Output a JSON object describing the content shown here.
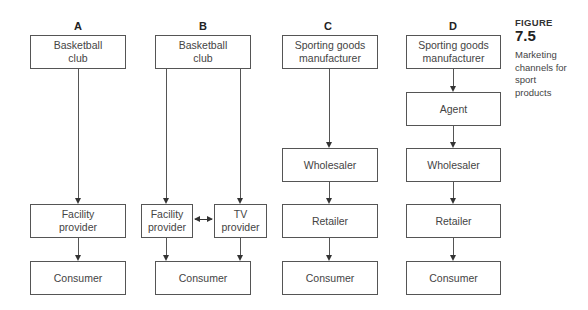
{
  "figure": {
    "kicker": "FIGURE",
    "number": "7.5",
    "caption": "Marketing channels for sport products"
  },
  "columns": {
    "A": {
      "label": "A",
      "nodes": [
        "Basketball club",
        "Facility provider",
        "Consumer"
      ]
    },
    "B": {
      "label": "B",
      "nodes": [
        "Basketball club",
        "Facility provider",
        "TV provider",
        "Consumer"
      ]
    },
    "C": {
      "label": "C",
      "nodes": [
        "Sporting goods manufacturer",
        "Wholesaler",
        "Retailer",
        "Consumer"
      ]
    },
    "D": {
      "label": "D",
      "nodes": [
        "Sporting goods manufacturer",
        "Agent",
        "Wholesaler",
        "Retailer",
        "Consumer"
      ]
    }
  },
  "edges": [
    [
      "A.0",
      "A.1"
    ],
    [
      "A.1",
      "A.2"
    ],
    [
      "B.0",
      "B.1"
    ],
    [
      "B.0",
      "B.2"
    ],
    [
      "B.1",
      "B.2",
      "bidirectional"
    ],
    [
      "B.1",
      "B.3"
    ],
    [
      "B.2",
      "B.3"
    ],
    [
      "C.0",
      "C.1"
    ],
    [
      "C.1",
      "C.2"
    ],
    [
      "C.2",
      "C.3"
    ],
    [
      "D.0",
      "D.1"
    ],
    [
      "D.1",
      "D.2"
    ],
    [
      "D.2",
      "D.3"
    ],
    [
      "D.3",
      "D.4"
    ]
  ]
}
